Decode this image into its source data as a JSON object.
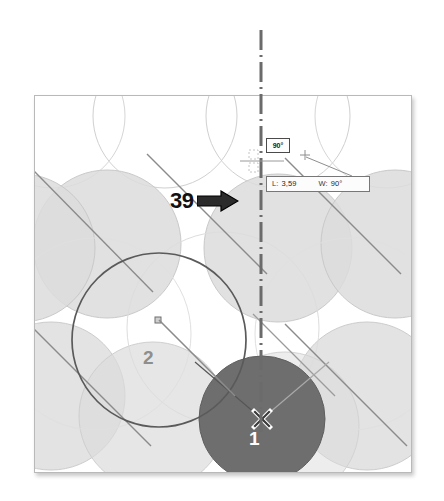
{
  "annotations": {
    "callout": {
      "number": "39",
      "icon": "arrow-right-icon"
    },
    "angle_badge": {
      "value": "90°"
    },
    "tooltip": {
      "length_label": "L:",
      "length_value": "3,59",
      "angle_label": "W:",
      "angle_value": "90°"
    },
    "part_labels": [
      {
        "text": "1",
        "color": "#ffffff"
      },
      {
        "text": "2",
        "color": "#8e8e8e"
      }
    ],
    "markers": {
      "center_x": "center-x-marker",
      "cursor": "cursor-plus-icon",
      "grip": "center-grip-handle"
    }
  },
  "colors": {
    "sheet_background": "#ffffff",
    "sheet_border": "#b9b9b9",
    "circle_fill_light": "#dcdcdc",
    "circle_outline": "#cccccc",
    "selected_part_fill": "#6e6e6e",
    "active_part_stroke": "#5a5a5a",
    "centerline": "#6b6b6b",
    "callout_text": "#111111",
    "arrow_fill": "#2b2b2b"
  }
}
